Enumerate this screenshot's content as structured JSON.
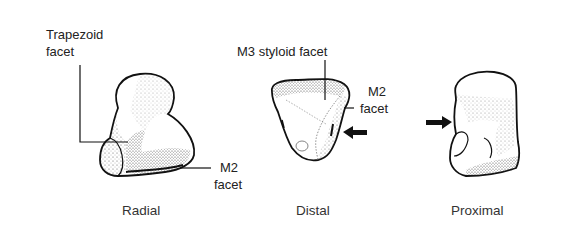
{
  "figure": {
    "views": [
      {
        "name": "radial",
        "caption": "Radial"
      },
      {
        "name": "distal",
        "caption": "Distal"
      },
      {
        "name": "proximal",
        "caption": "Proximal"
      }
    ],
    "labels": {
      "trapezoid_facet_line1": "Trapezoid",
      "trapezoid_facet_line2": "facet",
      "radial_m2_line1": "M2",
      "radial_m2_line2": "facet",
      "m3_styloid_facet": "M3 styloid facet",
      "distal_m2_line1": "M2",
      "distal_m2_line2": "facet"
    },
    "arrows": [
      {
        "view": "distal",
        "direction": "left"
      },
      {
        "view": "proximal",
        "direction": "right"
      }
    ],
    "colors": {
      "ink": "#1a1a1a",
      "background": "#ffffff"
    }
  }
}
